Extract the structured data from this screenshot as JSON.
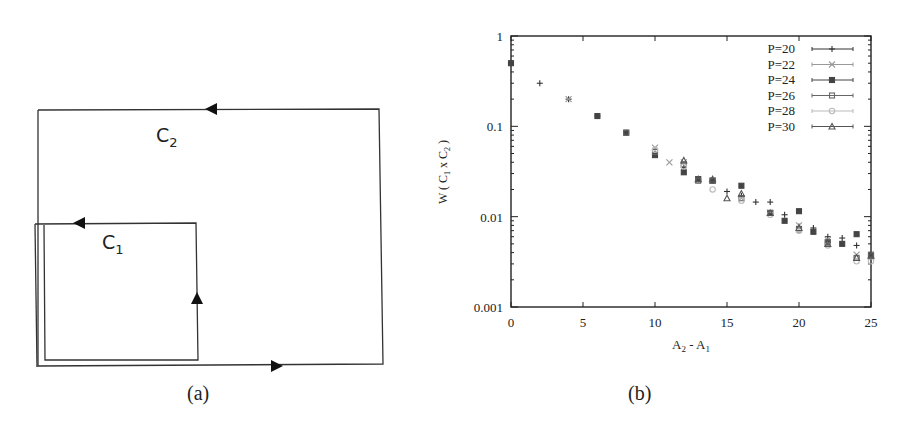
{
  "panel_a": {
    "caption": "(a)",
    "loops": [
      {
        "label": "C",
        "sub": "2",
        "name": "outer-loop-c2"
      },
      {
        "label": "C",
        "sub": "1",
        "name": "inner-loop-c1"
      }
    ]
  },
  "panel_b": {
    "caption": "(b)"
  },
  "chart_data": {
    "type": "scatter",
    "title": "",
    "xlabel": "A_2 - A_1",
    "ylabel": "W ( C_1 x C_2 )",
    "xlim": [
      0,
      25
    ],
    "ylim": [
      0.001,
      1
    ],
    "yscale": "log",
    "xticks": [
      "0",
      "5",
      "10",
      "15",
      "20",
      "25"
    ],
    "yticks": [
      "0.001",
      "0.01",
      "0.1",
      "1"
    ],
    "grid": false,
    "legend_position": "top-right",
    "series": [
      {
        "name": "P=20",
        "marker": "+",
        "color": "#333333",
        "x": [
          0,
          2,
          4,
          6,
          8,
          10,
          12,
          13,
          14,
          15,
          16,
          17,
          18,
          19,
          20,
          21,
          22,
          23,
          24,
          25
        ],
        "y": [
          0.5,
          0.3,
          0.2,
          0.13,
          0.085,
          0.05,
          0.035,
          0.026,
          0.025,
          0.019,
          0.017,
          0.0145,
          0.0145,
          0.0105,
          0.0078,
          0.0075,
          0.006,
          0.0058,
          0.0048,
          0.0038
        ]
      },
      {
        "name": "P=22",
        "marker": "x",
        "color": "#999999",
        "x": [
          4,
          10,
          11,
          12,
          13,
          14,
          16,
          18,
          20,
          22,
          24,
          25
        ],
        "y": [
          0.2,
          0.058,
          0.04,
          0.04,
          0.026,
          0.025,
          0.016,
          0.011,
          0.008,
          0.0055,
          0.0038,
          0.0036
        ]
      },
      {
        "name": "P=24",
        "marker": "*",
        "color": "#444444",
        "x": [
          0,
          6,
          8,
          10,
          12,
          13,
          14,
          16,
          18,
          19,
          20,
          21,
          22,
          23,
          24,
          25
        ],
        "y": [
          0.5,
          0.13,
          0.085,
          0.048,
          0.031,
          0.026,
          0.025,
          0.022,
          0.011,
          0.009,
          0.0115,
          0.0068,
          0.0052,
          0.005,
          0.0064,
          0.0037
        ]
      },
      {
        "name": "P=26",
        "marker": "square",
        "color": "#666666",
        "x": [
          8,
          10,
          12,
          13,
          14,
          16,
          18,
          20,
          22,
          24,
          25
        ],
        "y": [
          0.085,
          0.052,
          0.038,
          0.025,
          0.025,
          0.016,
          0.011,
          0.0072,
          0.0052,
          0.0035,
          0.0038
        ]
      },
      {
        "name": "P=28",
        "marker": "circle",
        "color": "#bbbbbb",
        "x": [
          10,
          12,
          14,
          16,
          18,
          20,
          22,
          24,
          25
        ],
        "y": [
          0.055,
          0.036,
          0.02,
          0.015,
          0.0105,
          0.007,
          0.0048,
          0.0032,
          0.0032
        ]
      },
      {
        "name": "P=30",
        "marker": "triangle",
        "color": "#555555",
        "x": [
          12,
          13,
          14,
          15,
          16,
          18,
          20,
          22,
          24,
          25
        ],
        "y": [
          0.042,
          0.026,
          0.026,
          0.016,
          0.018,
          0.011,
          0.0075,
          0.005,
          0.0035,
          0.0037
        ]
      }
    ]
  }
}
